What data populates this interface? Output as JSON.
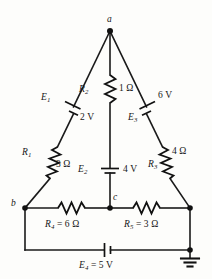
{
  "figure": {
    "type": "circuit-schematic",
    "title": "",
    "background_color": "#fdfdfb",
    "line_color": "#111111"
  },
  "nodes": [
    {
      "id": "a",
      "label": "a",
      "position": "apex-top"
    },
    {
      "id": "b",
      "label": "b",
      "position": "bottom-left"
    },
    {
      "id": "c",
      "label": "c",
      "position": "bottom-center"
    }
  ],
  "components": {
    "E1": {
      "name": "E1",
      "symbol": "battery",
      "label": "E",
      "subscript": "1",
      "value": "2 V",
      "branch": "a-to-b (left side)"
    },
    "E2": {
      "name": "E2",
      "symbol": "battery",
      "label": "E",
      "subscript": "2",
      "value": "4 V",
      "branch": "a-to-c (center vertical)"
    },
    "E3": {
      "name": "E3",
      "symbol": "battery",
      "label": "E",
      "subscript": "3",
      "value": "6 V",
      "branch": "a-to-right (right side)"
    },
    "E4": {
      "name": "E4",
      "symbol": "battery",
      "label": "E",
      "subscript": "4",
      "value": "5 V",
      "full_label": " = 5 V",
      "branch": "bottom rail"
    },
    "R1": {
      "name": "R1",
      "symbol": "resistor",
      "label": "R",
      "subscript": "1",
      "value": "3 Ω",
      "branch": "a-to-b (left side)"
    },
    "R2": {
      "name": "R2",
      "symbol": "resistor",
      "label": "R",
      "subscript": "2",
      "value": "1 Ω",
      "branch": "a-to-c (center vertical)"
    },
    "R3": {
      "name": "R3",
      "symbol": "resistor",
      "label": "R",
      "subscript": "3",
      "value": "4 Ω",
      "branch": "a-to-right (right side)"
    },
    "R4": {
      "name": "R4",
      "symbol": "resistor",
      "label": "R",
      "subscript": "4",
      "value": "6 Ω",
      "full_label": " = 6 Ω",
      "branch": "b-to-c (bottom left segment)"
    },
    "R5": {
      "name": "R5",
      "symbol": "resistor",
      "label": "R",
      "subscript": "5",
      "value": "3 Ω",
      "full_label": " = 3 Ω",
      "branch": "c-to-right (bottom right segment)"
    },
    "ground": {
      "name": "ground",
      "symbol": "earth-ground",
      "label": "",
      "position": "bottom-right"
    }
  }
}
